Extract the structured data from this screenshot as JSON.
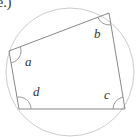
{
  "part_label": "e.)",
  "diagram": {
    "type": "cyclic-quadrilateral",
    "circle": {
      "cx": 70,
      "cy": 72,
      "r": 64,
      "stroke": "#cccccc"
    },
    "edge_color": "#888888",
    "vertices": [
      {
        "name": "top-left",
        "x": 9,
        "y": 51
      },
      {
        "name": "top-right",
        "x": 109,
        "y": 13
      },
      {
        "name": "bottom-right",
        "x": 125,
        "y": 109
      },
      {
        "name": "bottom-left",
        "x": 19,
        "y": 109
      }
    ],
    "angles": [
      {
        "label": "a",
        "vertex": "top-left"
      },
      {
        "label": "b",
        "vertex": "top-right"
      },
      {
        "label": "c",
        "vertex": "bottom-right"
      },
      {
        "label": "d",
        "vertex": "bottom-left"
      }
    ]
  }
}
